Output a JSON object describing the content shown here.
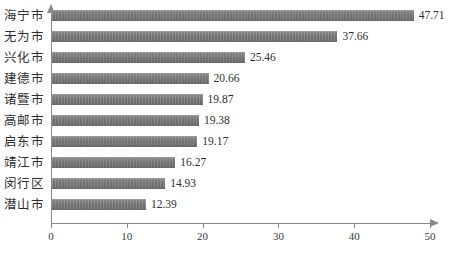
{
  "chart_data": {
    "type": "bar",
    "orientation": "horizontal",
    "title": "",
    "xlabel": "",
    "ylabel": "",
    "xlim": [
      0,
      50
    ],
    "grid": false,
    "legend": null,
    "categories": [
      "海宁市",
      "无为市",
      "兴化市",
      "建德市",
      "诸暨市",
      "高邮市",
      "启东市",
      "靖江市",
      "闵行区",
      "潜山市"
    ],
    "values": [
      47.71,
      37.66,
      25.46,
      20.66,
      19.87,
      19.38,
      19.17,
      16.27,
      14.93,
      12.39
    ],
    "value_labels": [
      "47.71",
      "37.66",
      "25.46",
      "20.66",
      "19.87",
      "19.38",
      "19.17",
      "16.27",
      "14.93",
      "12.39"
    ],
    "x_ticks": [
      0,
      10,
      20,
      30,
      40,
      50
    ],
    "x_tick_labels": [
      "0",
      "10",
      "20",
      "30",
      "40",
      "50"
    ],
    "bar_color": "#7b7b7b",
    "axis_color": "#8a8a8a",
    "text_color": "#2e2e2e",
    "background_color": "#ffffff"
  },
  "caption": {
    "text": ""
  }
}
